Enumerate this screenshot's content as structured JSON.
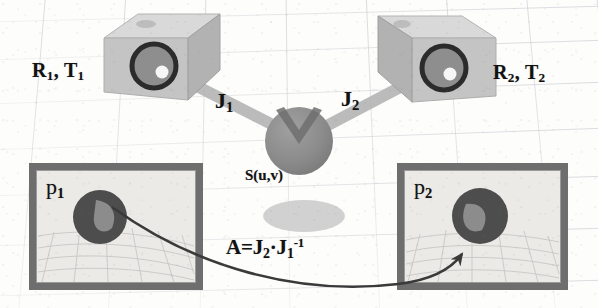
{
  "figure": {
    "kind": "technical-diagram",
    "background_color": "#fdfdfc",
    "ink_color": "#121212"
  },
  "cameras": [
    {
      "id": "camera-left",
      "pose_label": "R",
      "pose_label_full": "R₁, T₁",
      "pose_sub1": "1",
      "pose_sub2": "1",
      "pose_t": "T",
      "comma": ",",
      "body_color": "#c3c3c3",
      "top_color": "#d8d8d8",
      "side_color": "#a8a8a8",
      "lens_ring_color": "#2b2b2b",
      "lens_fill_color": "#8e8e8e",
      "lens_highlight_color": "#f4f4f4"
    },
    {
      "id": "camera-right",
      "pose_label": "R",
      "pose_label_full": "R₂, T₂",
      "pose_sub1": "2",
      "pose_sub2": "2",
      "pose_t": "T",
      "comma": ",",
      "body_color": "#c3c3c3",
      "top_color": "#d8d8d8",
      "side_color": "#a8a8a8",
      "lens_ring_color": "#2b2b2b",
      "lens_fill_color": "#8e8e8e",
      "lens_highlight_color": "#f4f4f4"
    }
  ],
  "rays": [
    {
      "id": "ray-left",
      "label": "J",
      "subscript": "1",
      "color": "#b0b0b0"
    },
    {
      "id": "ray-right",
      "label": "J",
      "subscript": "2",
      "color": "#b0b0b0"
    }
  ],
  "surface_point": {
    "label": "S(u,v)",
    "sphere_color": "#8c8c8c",
    "notch_color": "#6f6f6f",
    "shadow_color": "#c9c9c9"
  },
  "image_planes": [
    {
      "id": "plane-left",
      "label": "p",
      "subscript": "1",
      "frame_color": "#6e6e6e",
      "fill_color": "#eceae6",
      "patch_color": "#4d4d4d",
      "patch_inner_color": "#8f8f8f"
    },
    {
      "id": "plane-right",
      "label": "p",
      "subscript": "2",
      "frame_color": "#6e6e6e",
      "fill_color": "#eceae6",
      "patch_color": "#4d4d4d",
      "patch_inner_color": "#8f8f8f"
    }
  ],
  "warp": {
    "formula_plain": "A=J₂·J₁⁻¹",
    "a_token": "A=",
    "j2_token": "J",
    "j2_sub": "2",
    "dot_token": "·",
    "j1_token": "J",
    "j1_sub": "1",
    "j1_sup": "-1",
    "arrow_color": "#3a3a3a",
    "arrow_description": "curved arrow from left image patch to right image patch"
  }
}
